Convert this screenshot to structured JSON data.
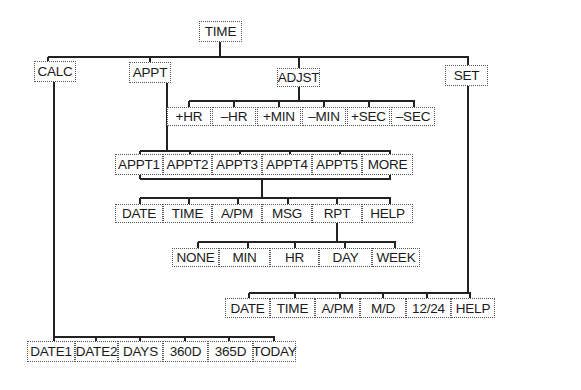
{
  "diagram": {
    "type": "menu-hierarchy-tree",
    "root": {
      "id": "time",
      "label": "TIME",
      "box": [
        199,
        21,
        43,
        21
      ]
    },
    "level1": [
      {
        "id": "calc",
        "label": "CALC",
        "box": [
          34,
          61,
          42,
          21
        ]
      },
      {
        "id": "appt",
        "label": "APPT",
        "box": [
          129,
          62,
          42,
          21
        ]
      },
      {
        "id": "adjst",
        "label": "ADJST",
        "box": [
          277,
          68,
          43,
          19
        ]
      },
      {
        "id": "set",
        "label": "SET",
        "box": [
          445,
          65,
          43,
          21
        ]
      }
    ],
    "adjst_children": [
      {
        "label": "+HR",
        "box": [
          167,
          107,
          44,
          19
        ]
      },
      {
        "label": "–HR",
        "box": [
          212,
          107,
          44,
          19
        ]
      },
      {
        "label": "+MIN",
        "box": [
          257,
          107,
          44,
          19
        ]
      },
      {
        "label": "–MIN",
        "box": [
          302,
          107,
          44,
          19
        ]
      },
      {
        "label": "+SEC",
        "box": [
          347,
          107,
          43,
          19
        ]
      },
      {
        "label": "–SEC",
        "box": [
          391,
          107,
          44,
          19
        ]
      }
    ],
    "appt_children": [
      {
        "label": "APPT1",
        "box": [
          115,
          154,
          48,
          21
        ]
      },
      {
        "label": "APPT2",
        "box": [
          163,
          154,
          49,
          21
        ]
      },
      {
        "label": "APPT3",
        "box": [
          212,
          154,
          50,
          21
        ]
      },
      {
        "label": "APPT4",
        "box": [
          262,
          154,
          50,
          21
        ]
      },
      {
        "label": "APPT5",
        "box": [
          312,
          154,
          50,
          21
        ]
      },
      {
        "label": "MORE",
        "box": [
          362,
          154,
          51,
          21
        ]
      }
    ],
    "appt_item_children": [
      {
        "label": "DATE",
        "box": [
          115,
          204,
          48,
          19
        ]
      },
      {
        "label": "TIME",
        "box": [
          163,
          204,
          49,
          19
        ]
      },
      {
        "label": "A/PM",
        "box": [
          212,
          204,
          50,
          19
        ]
      },
      {
        "label": "MSG",
        "box": [
          262,
          204,
          50,
          19
        ]
      },
      {
        "label": "RPT",
        "box": [
          312,
          204,
          50,
          19
        ]
      },
      {
        "label": "HELP",
        "box": [
          362,
          204,
          51,
          19
        ]
      }
    ],
    "rpt_children": [
      {
        "label": "NONE",
        "box": [
          172,
          248,
          47,
          19
        ]
      },
      {
        "label": "MIN",
        "box": [
          219,
          248,
          51,
          19
        ]
      },
      {
        "label": "HR",
        "box": [
          270,
          248,
          49,
          19
        ]
      },
      {
        "label": "DAY",
        "box": [
          319,
          248,
          53,
          19
        ]
      },
      {
        "label": "WEEK",
        "box": [
          372,
          248,
          48,
          19
        ]
      }
    ],
    "set_children": [
      {
        "label": "DATE",
        "box": [
          225,
          298,
          45,
          20
        ]
      },
      {
        "label": "TIME",
        "box": [
          270,
          298,
          45,
          20
        ]
      },
      {
        "label": "A/PM",
        "box": [
          315,
          298,
          45,
          20
        ]
      },
      {
        "label": "M/D",
        "box": [
          360,
          298,
          46,
          20
        ]
      },
      {
        "label": "12/24",
        "box": [
          406,
          298,
          45,
          20
        ]
      },
      {
        "label": "HELP",
        "box": [
          451,
          298,
          44,
          20
        ]
      }
    ],
    "calc_children": [
      {
        "label": "DATE1",
        "box": [
          27,
          341,
          48,
          21
        ]
      },
      {
        "label": "DATE2",
        "box": [
          75,
          341,
          43,
          21
        ]
      },
      {
        "label": "DAYS",
        "box": [
          118,
          341,
          45,
          21
        ]
      },
      {
        "label": "360D",
        "box": [
          163,
          341,
          45,
          21
        ]
      },
      {
        "label": "365D",
        "box": [
          208,
          341,
          45,
          21
        ]
      },
      {
        "label": "TODAY",
        "box": [
          253,
          341,
          43,
          21
        ]
      }
    ],
    "connectors": [
      [
        220,
        42,
        220,
        57
      ],
      [
        48,
        57,
        468,
        57
      ],
      [
        48,
        57,
        48,
        61
      ],
      [
        150,
        57,
        150,
        62
      ],
      [
        299,
        57,
        299,
        68
      ],
      [
        468,
        57,
        468,
        65
      ],
      [
        299,
        87,
        299,
        101
      ],
      [
        189,
        101,
        414,
        101
      ],
      [
        189,
        101,
        189,
        107
      ],
      [
        234,
        101,
        234,
        107
      ],
      [
        279,
        101,
        279,
        107
      ],
      [
        324,
        101,
        324,
        107
      ],
      [
        369,
        101,
        369,
        107
      ],
      [
        414,
        101,
        414,
        107
      ],
      [
        54,
        82,
        54,
        337
      ],
      [
        167,
        83,
        167,
        151
      ],
      [
        140,
        151,
        390,
        151
      ],
      [
        140,
        151,
        140,
        154
      ],
      [
        190,
        151,
        190,
        154
      ],
      [
        240,
        151,
        240,
        154
      ],
      [
        290,
        151,
        290,
        154
      ],
      [
        340,
        151,
        340,
        154
      ],
      [
        390,
        151,
        390,
        154
      ],
      [
        140,
        175,
        140,
        179
      ],
      [
        390,
        175,
        390,
        179
      ],
      [
        140,
        179,
        390,
        179
      ],
      [
        262,
        179,
        262,
        198
      ],
      [
        140,
        198,
        390,
        198
      ],
      [
        140,
        198,
        140,
        204
      ],
      [
        189,
        198,
        189,
        204
      ],
      [
        238,
        198,
        238,
        204
      ],
      [
        288,
        198,
        288,
        204
      ],
      [
        337,
        198,
        337,
        204
      ],
      [
        390,
        198,
        390,
        204
      ],
      [
        337,
        223,
        337,
        242
      ],
      [
        198,
        242,
        395,
        242
      ],
      [
        198,
        242,
        198,
        248
      ],
      [
        248,
        242,
        248,
        248
      ],
      [
        295,
        242,
        295,
        248
      ],
      [
        345,
        242,
        345,
        248
      ],
      [
        395,
        242,
        395,
        248
      ],
      [
        468,
        86,
        468,
        293
      ],
      [
        249,
        293,
        470,
        293
      ],
      [
        249,
        293,
        249,
        298
      ],
      [
        295,
        293,
        295,
        298
      ],
      [
        340,
        293,
        340,
        298
      ],
      [
        383,
        293,
        383,
        298
      ],
      [
        427,
        293,
        427,
        298
      ],
      [
        470,
        293,
        470,
        298
      ],
      [
        54,
        337,
        274,
        337
      ],
      [
        54,
        337,
        54,
        341
      ],
      [
        96,
        337,
        96,
        341
      ],
      [
        140,
        337,
        140,
        341
      ],
      [
        185,
        337,
        185,
        341
      ],
      [
        229,
        337,
        229,
        341
      ],
      [
        274,
        337,
        274,
        341
      ]
    ]
  }
}
